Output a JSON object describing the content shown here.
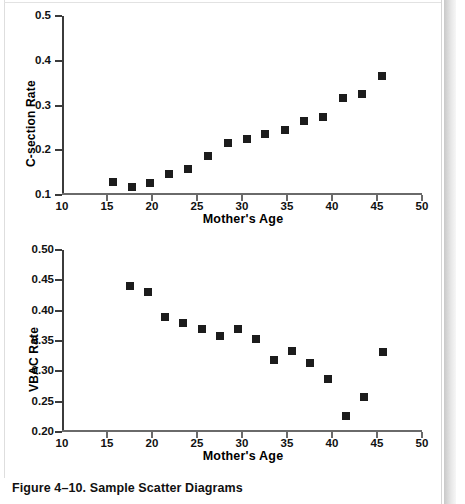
{
  "caption": "Figure 4–10. Sample Scatter Diagrams",
  "chart_data": [
    {
      "type": "scatter",
      "id": "c-section",
      "title": "",
      "xlabel": "Mother's Age",
      "ylabel": "C-section Rate",
      "xlim": [
        10,
        50
      ],
      "ylim": [
        0.1,
        0.5
      ],
      "xticks": [
        10,
        15,
        20,
        25,
        30,
        35,
        40,
        45,
        50
      ],
      "xtick_labels": [
        "10",
        "15",
        "20",
        "25",
        "30",
        "35",
        "40",
        "45",
        "50"
      ],
      "yticks": [
        0.1,
        0.2,
        0.3,
        0.4,
        0.5
      ],
      "ytick_labels": [
        "0.1",
        "0.2",
        "0.3",
        "0.4",
        "0.5"
      ],
      "grid": false,
      "legend": "none",
      "marker": "filled-square",
      "marker_color": "#1c1c1c",
      "x": [
        15.7,
        17.8,
        19.8,
        21.9,
        24.0,
        26.2,
        28.4,
        30.5,
        32.6,
        34.8,
        36.9,
        39.0,
        41.2,
        43.3,
        45.5
      ],
      "y": [
        0.128,
        0.118,
        0.127,
        0.147,
        0.157,
        0.188,
        0.216,
        0.226,
        0.236,
        0.245,
        0.265,
        0.275,
        0.316,
        0.325,
        0.366
      ]
    },
    {
      "type": "scatter",
      "id": "vbac",
      "title": "",
      "xlabel": "Mother's Age",
      "ylabel": "VBAC Rate",
      "xlim": [
        10,
        50
      ],
      "ylim": [
        0.2,
        0.5
      ],
      "xticks": [
        10,
        15,
        20,
        25,
        30,
        35,
        40,
        45,
        50
      ],
      "xtick_labels": [
        "10",
        "15",
        "20",
        "25",
        "30",
        "35",
        "40",
        "45",
        "50"
      ],
      "yticks": [
        0.2,
        0.25,
        0.3,
        0.35,
        0.4,
        0.45,
        0.5
      ],
      "ytick_labels": [
        "0.20",
        "0.25",
        "0.30",
        "0.35",
        "0.40",
        "0.45",
        "0.50"
      ],
      "grid": false,
      "legend": "none",
      "marker": "filled-square",
      "marker_color": "#1c1c1c",
      "x": [
        17.6,
        19.5,
        21.4,
        23.4,
        25.5,
        27.5,
        29.5,
        31.5,
        33.5,
        35.5,
        37.6,
        39.6,
        41.6,
        43.6,
        45.7
      ],
      "y": [
        0.44,
        0.43,
        0.39,
        0.379,
        0.369,
        0.359,
        0.369,
        0.353,
        0.318,
        0.333,
        0.313,
        0.288,
        0.227,
        0.257,
        0.332
      ]
    }
  ]
}
